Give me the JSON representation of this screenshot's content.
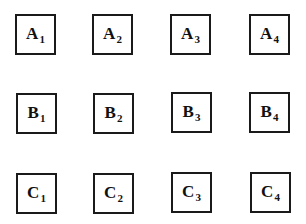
{
  "grid": {
    "rows": [
      {
        "row": "A",
        "cells": [
          {
            "letter": "A",
            "index": "1"
          },
          {
            "letter": "A",
            "index": "2"
          },
          {
            "letter": "A",
            "index": "3"
          },
          {
            "letter": "A",
            "index": "4"
          }
        ]
      },
      {
        "row": "B",
        "cells": [
          {
            "letter": "B",
            "index": "1"
          },
          {
            "letter": "B",
            "index": "2"
          },
          {
            "letter": "B",
            "index": "3"
          },
          {
            "letter": "B",
            "index": "4"
          }
        ]
      },
      {
        "row": "C",
        "cells": [
          {
            "letter": "C",
            "index": "1"
          },
          {
            "letter": "C",
            "index": "2"
          },
          {
            "letter": "C",
            "index": "3"
          },
          {
            "letter": "C",
            "index": "4"
          }
        ]
      }
    ]
  }
}
